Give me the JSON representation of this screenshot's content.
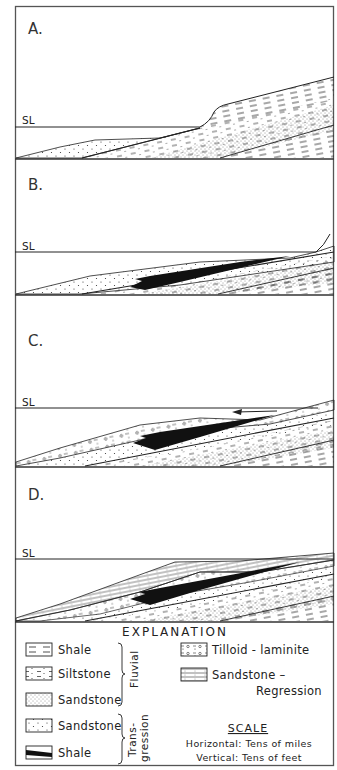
{
  "figure": {
    "type": "stratigraphic cross-section series",
    "panels": [
      {
        "id": "A",
        "label": "A.",
        "sea_level_label": "SL"
      },
      {
        "id": "B",
        "label": "B.",
        "sea_level_label": "SL"
      },
      {
        "id": "C",
        "label": "C.",
        "sea_level_label": "SL"
      },
      {
        "id": "D",
        "label": "D.",
        "sea_level_label": "SL"
      }
    ],
    "colors": {
      "ink": "#1a1a1a",
      "paper": "#ffffff",
      "frame": "#555555"
    }
  },
  "explanation": {
    "title": "EXPLANATION",
    "left_items": [
      {
        "pattern": "shale-dashes",
        "label": "Shale"
      },
      {
        "pattern": "siltstone-dash-dots",
        "label": "Siltstone"
      },
      {
        "pattern": "sandstone-fine-stipple",
        "label": "Sandstone"
      },
      {
        "pattern": "sandstone-sparse-dots",
        "label": "Sandstone"
      },
      {
        "pattern": "shale-black-band",
        "label": "Shale"
      }
    ],
    "groups": [
      {
        "label": "Fluvial",
        "covers": [
          "Shale",
          "Siltstone",
          "Sandstone"
        ]
      },
      {
        "label_line1": "Trans-",
        "label_line2": "gression",
        "covers": [
          "Sandstone",
          "Shale"
        ]
      }
    ],
    "right_items": [
      {
        "pattern": "tilloid-pebbles",
        "label": "Tilloid - laminite"
      },
      {
        "pattern": "sandstone-lined",
        "label_line1": "Sandstone –",
        "label_line2": "Regression"
      }
    ],
    "scale": {
      "title": "SCALE",
      "horizontal": "Horizontal: Tens of miles",
      "vertical": "Vertical: Tens of feet"
    }
  }
}
